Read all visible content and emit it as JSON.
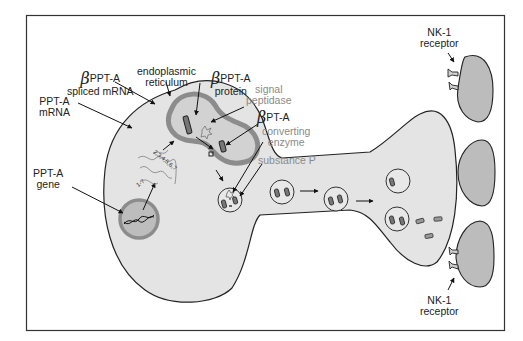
{
  "figure": {
    "type": "biological schematic",
    "colors": {
      "background": "#ffffff",
      "frame": "#333333",
      "cell_fill": "#e4e4e4",
      "nucleus_fill": "#bdbdbd",
      "nucleus_ring": "#8c8c8c",
      "target_cell_fill": "#bcbcbc",
      "outline": "#222222",
      "grey_label": "#8a8a8a"
    }
  },
  "labels": {
    "ppta_gene": {
      "line1": "PPT-A",
      "line2": "gene"
    },
    "ppta_mrna": {
      "line1": "PPT-A",
      "line2": "mRNA"
    },
    "beta_ppta_spliced_mrna": {
      "symbol": "β",
      "line1": "PPT-A",
      "line2": "spliced mRNA"
    },
    "endoplasmic_reticulum": {
      "line1": "endoplasmic",
      "line2": "reticulum"
    },
    "beta_ppta_protein": {
      "symbol": "β",
      "line1": "PPT-A",
      "line2": "protein"
    },
    "signal_peptidase": {
      "line1": "signal",
      "line2": "peptidase"
    },
    "beta_pt_a": {
      "symbol": "β",
      "line1": "PT-A"
    },
    "converting_enzyme": {
      "line1": "converting",
      "line2": "enzyme"
    },
    "substance_p": {
      "line1": "substance P"
    },
    "nk1_receptor_top": {
      "line1": "NK-1",
      "line2": "receptor"
    },
    "nk1_receptor_bottom": {
      "line1": "NK-1",
      "line2": "receptor"
    }
  },
  "annotations": {
    "exons_transcribed": "1-7",
    "exons_spliced": "2,3,4,5,6,7",
    "er_cleavage_note": "12,3..."
  },
  "structures": {
    "neuron_soma": "large oval cell body",
    "nucleus": "circle with DNA helix",
    "endoplasmic_reticulum": "kidney-shaped organelle with two rod proteins",
    "vesicles": [
      "vesicle at soma exit",
      "axon vesicle 1",
      "axon vesicle 2",
      "terminal vesicle 1",
      "terminal vesicle 2"
    ],
    "released_peptides": 3,
    "target_cells": 3,
    "receptor_groups": 2
  }
}
